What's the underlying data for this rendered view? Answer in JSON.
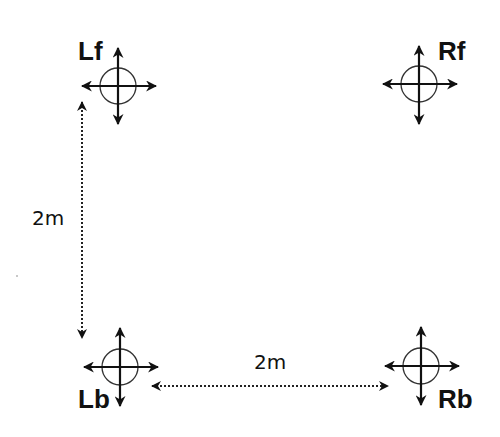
{
  "diagram": {
    "colors": {
      "stroke": "#111111",
      "circle": "#333333",
      "background": "#ffffff"
    },
    "nodes": [
      {
        "id": "Lf",
        "label": "Lf",
        "cx": 118,
        "cy": 86,
        "label_x": 78,
        "label_y": 38
      },
      {
        "id": "Rf",
        "label": "Rf",
        "cx": 419,
        "cy": 84,
        "label_x": 438,
        "label_y": 38
      },
      {
        "id": "Lb",
        "label": "Lb",
        "cx": 120,
        "cy": 367,
        "label_x": 78,
        "label_y": 386
      },
      {
        "id": "Rb",
        "label": "Rb",
        "cx": 421,
        "cy": 366,
        "label_x": 438,
        "label_y": 386
      }
    ],
    "dimensions": [
      {
        "id": "vertical",
        "label": "2m",
        "from": "Lf",
        "to": "Lb",
        "label_x": 32,
        "label_y": 208
      },
      {
        "id": "horizontal",
        "label": "2m",
        "from": "Lb",
        "to": "Rb",
        "label_x": 254,
        "label_y": 352
      }
    ]
  }
}
